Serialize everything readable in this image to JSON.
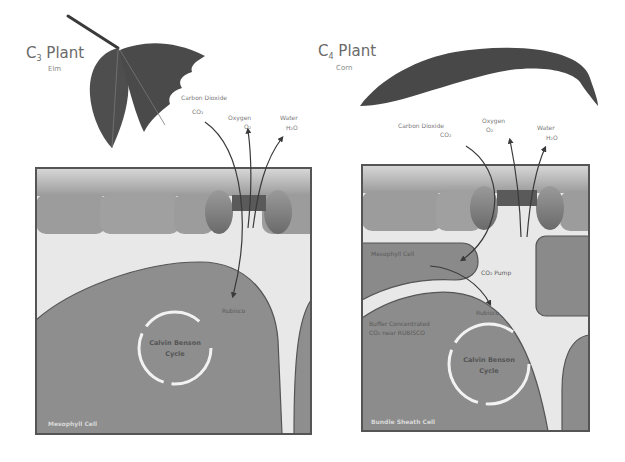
{
  "diagram": {
    "type": "comparison illustration",
    "colors": {
      "leaf": "#4a4a4a",
      "cell_fill": "#8c8c8c",
      "cell_dark": "#707070",
      "upper_layer": "#a8a8a8",
      "space": "#e6e6e6",
      "border": "#5a5a5a",
      "arrow": "#4a4a4a",
      "cycle_ring": "#f2f2f2"
    }
  },
  "c3": {
    "title": "C",
    "subscript": "3",
    "title_suffix": " Plant",
    "example": "Elm",
    "gases": {
      "co2_label": "Carbon Dioxide",
      "co2_formula": "CO₂",
      "o2_label": "Oxygen",
      "o2_formula": "O₂",
      "h2o_label": "Water",
      "h2o_formula": "H₂O"
    },
    "enzyme_label": "Rubisco",
    "cycle_line1": "Calvin Benson",
    "cycle_line2": "Cycle",
    "cell_label": "Mesophyll Cell"
  },
  "c4": {
    "title": "C",
    "subscript": "4",
    "title_suffix": " Plant",
    "example": "Corn",
    "gases": {
      "co2_label": "Carbon Dioxide",
      "co2_formula": "CO₂",
      "o2_label": "Oxygen",
      "o2_formula": "O₂",
      "h2o_label": "Water",
      "h2o_formula": "H₂O"
    },
    "mesophyll_label": "Mesophyll Cell",
    "pump_label": "CO₂ Pump",
    "enzyme_label": "Rubisco",
    "concentrate_line1": "Buffer Concentrated",
    "concentrate_line2": "CO₂ near RUBISCO",
    "cycle_line1": "Calvin Benson",
    "cycle_line2": "Cycle",
    "cell_label": "Bundle Sheath Cell"
  }
}
